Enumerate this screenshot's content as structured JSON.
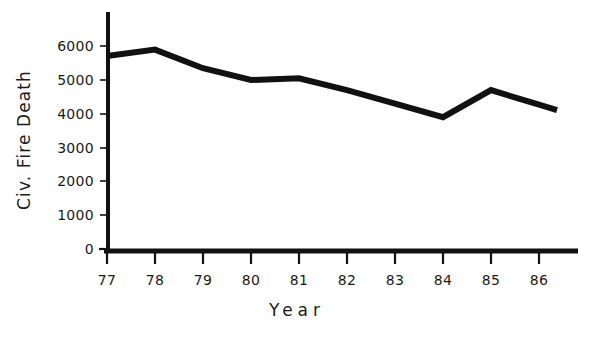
{
  "chart_data": {
    "type": "line",
    "title": "",
    "xlabel": "Year",
    "ylabel": "Civ. Fire Death",
    "categories": [
      "77",
      "78",
      "79",
      "80",
      "81",
      "82",
      "83",
      "84",
      "85",
      "86"
    ],
    "x": [
      77,
      78,
      79,
      80,
      81,
      82,
      83,
      84,
      85,
      86
    ],
    "values": [
      5710,
      5900,
      5350,
      5000,
      5050,
      4700,
      4300,
      3900,
      4700,
      4270
    ],
    "series": [
      {
        "name": "Civ. Fire Death",
        "values": [
          5710,
          5900,
          5350,
          5000,
          5050,
          4700,
          4300,
          3900,
          4700,
          4270
        ]
      }
    ],
    "ylim": [
      0,
      6800
    ],
    "xlim": [
      76.8,
      86.95
    ],
    "ytick_labels": [
      "0",
      "1000",
      "2000",
      "3000",
      "4000",
      "5000",
      "6000"
    ],
    "ytick_values": [
      0,
      1000,
      2000,
      3000,
      4000,
      5000,
      6000
    ],
    "xtick_labels": [
      "77",
      "78",
      "79",
      "80",
      "81",
      "82",
      "83",
      "84",
      "85",
      "86"
    ],
    "grid": false,
    "legend": false,
    "line_color": "#111111",
    "axis_color": "#111111"
  },
  "axes": {
    "y_title": "Civ. Fire Death",
    "x_title": "Year"
  },
  "y_ticks": [
    {
      "label": "6000",
      "value": 6000
    },
    {
      "label": "5000",
      "value": 5000
    },
    {
      "label": "4000",
      "value": 4000
    },
    {
      "label": "3000",
      "value": 3000
    },
    {
      "label": "2000",
      "value": 2000
    },
    {
      "label": "1000",
      "value": 1000
    },
    {
      "label": "0",
      "value": 0
    }
  ],
  "x_ticks": [
    {
      "label": "77"
    },
    {
      "label": "78"
    },
    {
      "label": "79"
    },
    {
      "label": "80"
    },
    {
      "label": "81"
    },
    {
      "label": "82"
    },
    {
      "label": "83"
    },
    {
      "label": "84"
    },
    {
      "label": "85"
    },
    {
      "label": "86"
    }
  ]
}
